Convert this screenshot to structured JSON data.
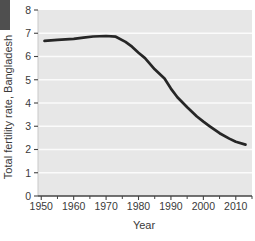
{
  "figure": {
    "corner_tab_color": "#4f4f4f"
  },
  "chart_data": {
    "type": "line",
    "title": "",
    "xlabel": "Year",
    "ylabel": "Total fertility rate, Bangladesh",
    "xlim": [
      1949,
      2015
    ],
    "ylim": [
      0,
      8
    ],
    "x_major_ticks": [
      1950,
      1960,
      1970,
      1980,
      1990,
      2000,
      2010
    ],
    "x_tick_labels": [
      "1950",
      "1960",
      "1970",
      "1980",
      "1990",
      "2000",
      "2010"
    ],
    "x_minor_ticks": [
      1955,
      1965,
      1975,
      1985,
      1995,
      2005,
      2015
    ],
    "y_ticks": [
      0,
      1,
      2,
      3,
      4,
      5,
      6,
      7,
      8
    ],
    "y_tick_labels": [
      "0",
      "1",
      "2",
      "3",
      "4",
      "5",
      "6",
      "7",
      "8"
    ],
    "grid": {
      "horizontal": true,
      "vertical": false,
      "color": "#fbfbfb"
    },
    "legend": "none",
    "plot_background": "#e7e7e7",
    "axis_color": "#444444",
    "text_color": "#3a3a3a",
    "series": [
      {
        "name": "Total fertility rate, Bangladesh",
        "color": "#262626",
        "x": [
          1951,
          1955,
          1960,
          1963,
          1966,
          1970,
          1973,
          1976,
          1978,
          1980,
          1982,
          1985,
          1988,
          1990,
          1992,
          1995,
          1998,
          2000,
          2002,
          2005,
          2008,
          2010,
          2013
        ],
        "values": [
          6.67,
          6.72,
          6.76,
          6.81,
          6.86,
          6.88,
          6.85,
          6.63,
          6.42,
          6.16,
          5.93,
          5.45,
          5.05,
          4.62,
          4.25,
          3.82,
          3.42,
          3.2,
          3.0,
          2.7,
          2.47,
          2.33,
          2.21
        ]
      }
    ]
  }
}
